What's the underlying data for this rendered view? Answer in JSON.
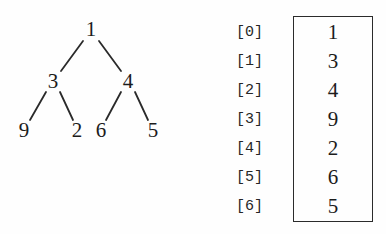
{
  "figure": {
    "background_color": "#fefefe",
    "ink_color": "#1c1c1c"
  },
  "tree": {
    "caption": "binary-tree-diagram",
    "nodes": [
      {
        "id": "n0",
        "label": "1",
        "x": 91,
        "y": 30,
        "level": 0,
        "array_index": 0
      },
      {
        "id": "n1",
        "label": "3",
        "x": 53,
        "y": 82,
        "level": 1,
        "array_index": 1
      },
      {
        "id": "n2",
        "label": "4",
        "x": 128,
        "y": 82,
        "level": 1,
        "array_index": 2
      },
      {
        "id": "n3",
        "label": "9",
        "x": 24,
        "y": 131,
        "level": 2,
        "array_index": 3
      },
      {
        "id": "n4",
        "label": "2",
        "x": 77,
        "y": 131,
        "level": 2,
        "array_index": 4
      },
      {
        "id": "n5",
        "label": "6",
        "x": 101,
        "y": 131,
        "level": 2,
        "array_index": 5
      },
      {
        "id": "n6",
        "label": "5",
        "x": 153,
        "y": 131,
        "level": 2,
        "array_index": 6
      }
    ],
    "edges": [
      {
        "from": "n0",
        "to": "n1",
        "x1": 83,
        "y1": 41,
        "x2": 61,
        "y2": 71
      },
      {
        "from": "n0",
        "to": "n2",
        "x1": 99,
        "y1": 41,
        "x2": 121,
        "y2": 71
      },
      {
        "from": "n1",
        "to": "n3",
        "x1": 46,
        "y1": 92,
        "x2": 30,
        "y2": 120
      },
      {
        "from": "n1",
        "to": "n4",
        "x1": 60,
        "y1": 92,
        "x2": 73,
        "y2": 120
      },
      {
        "from": "n2",
        "to": "n5",
        "x1": 121,
        "y1": 92,
        "x2": 106,
        "y2": 120
      },
      {
        "from": "n2",
        "to": "n6",
        "x1": 135,
        "y1": 92,
        "x2": 148,
        "y2": 120
      }
    ],
    "edge_color": "#2a2a2a",
    "edge_width": 1.8
  },
  "array": {
    "caption": "array-representation",
    "box_border_color": "#2b2b2b",
    "rows": [
      {
        "index_label": "[0]",
        "value": "1"
      },
      {
        "index_label": "[1]",
        "value": "3"
      },
      {
        "index_label": "[2]",
        "value": "4"
      },
      {
        "index_label": "[3]",
        "value": "9"
      },
      {
        "index_label": "[4]",
        "value": "2"
      },
      {
        "index_label": "[5]",
        "value": "6"
      },
      {
        "index_label": "[6]",
        "value": "5"
      }
    ]
  }
}
